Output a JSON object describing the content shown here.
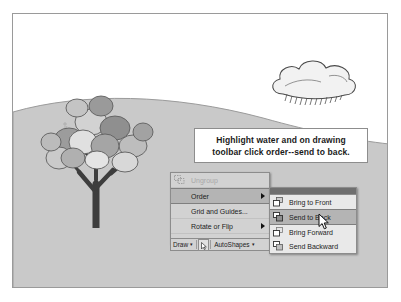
{
  "scene": {
    "description": "Clip-art drawing of a tree on a hill with a cloud",
    "colors": {
      "ground": "#c9c9c9",
      "sky": "#ffffff",
      "tree_trunk": "#3d3d3d",
      "foliage_dark": "#8a8a8a",
      "foliage_light": "#d0d0d0",
      "frame_border": "#9a9a9a"
    }
  },
  "callout": {
    "line1": "Highlight water and on drawing",
    "line2": "toolbar click order--send to back."
  },
  "menu": {
    "items": [
      {
        "label": "Ungroup",
        "icon": "ungroup-icon",
        "disabled": true,
        "submenu": false
      },
      {
        "label": "Order",
        "icon": "",
        "disabled": false,
        "submenu": true,
        "selected": true
      },
      {
        "label": "Grid and Guides...",
        "icon": "",
        "disabled": false,
        "submenu": false
      },
      {
        "label": "Rotate or Flip",
        "icon": "",
        "disabled": false,
        "submenu": true
      }
    ],
    "overflow_glyph": "⌵"
  },
  "submenu": {
    "items": [
      {
        "label": "Bring to Front",
        "underline": "F",
        "icon": "bring-to-front-icon",
        "selected": false
      },
      {
        "label": "Send to Back",
        "underline": "B",
        "icon": "send-to-back-icon",
        "selected": true
      },
      {
        "label": "Bring Forward",
        "underline": "F",
        "icon": "bring-forward-icon",
        "selected": false
      },
      {
        "label": "Send Backward",
        "underline": "B",
        "icon": "send-backward-icon",
        "selected": false
      }
    ]
  },
  "toolbar": {
    "draw_label": "Draw",
    "autoshapes_label": "AutoShapes",
    "caret": "▾",
    "select_icon": "select-arrow-icon"
  }
}
